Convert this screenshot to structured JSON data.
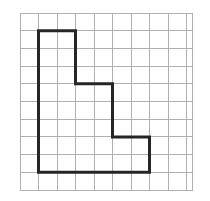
{
  "figure": {
    "background_color": "#ffffff"
  },
  "grid": {
    "name": "square-grid",
    "origin_x": 20,
    "origin_y": 13,
    "cell_width": 18.5,
    "cell_height": 17.7,
    "columns": 9,
    "rows": 10,
    "extra_column_fraction": 0.35,
    "line_color": "#a9a9a9",
    "line_width": 0.9
  },
  "shape": {
    "name": "staircase-polygon",
    "stroke_color": "#262626",
    "stroke_width": 3,
    "fill": "none",
    "closed": true,
    "vertices_grid": [
      [
        1,
        1
      ],
      [
        3,
        1
      ],
      [
        3,
        4
      ],
      [
        5,
        4
      ],
      [
        5,
        7
      ],
      [
        7,
        7
      ],
      [
        7,
        9
      ],
      [
        1,
        9
      ]
    ],
    "vertices_px": [
      [
        38.5,
        30.7
      ],
      [
        75.5,
        30.7
      ],
      [
        75.5,
        83.8
      ],
      [
        112.5,
        83.8
      ],
      [
        112.5,
        136.9
      ],
      [
        149.5,
        136.9
      ],
      [
        149.5,
        172.3
      ],
      [
        38.5,
        172.3
      ]
    ],
    "side_count": 8,
    "area_cells": 28,
    "perimeter_cells": 24
  },
  "chart_data": {
    "type": "scatter",
    "xlabel": "",
    "ylabel": "",
    "xlim": [
      0,
      9
    ],
    "ylim": [
      0,
      10
    ],
    "grid": true,
    "legend": "none",
    "x": [
      1,
      3,
      3,
      5,
      5,
      7,
      7,
      1
    ],
    "y": [
      1,
      1,
      4,
      4,
      7,
      7,
      9,
      9
    ],
    "annotations": []
  }
}
